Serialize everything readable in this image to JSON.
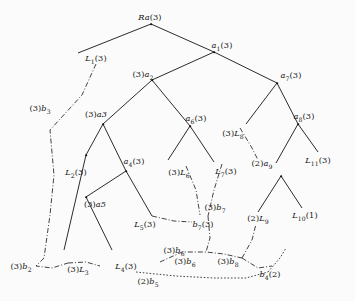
{
  "figure": {
    "kind": "tree-diagram",
    "background_color": "#fbfbfb",
    "ink_color": "#141414",
    "solid_edge_style": "solid",
    "aux_edge_style": "dash-dot",
    "dotted_edge_style": "dotted"
  },
  "labels": [
    {
      "id": "root",
      "text": "Ra(3)",
      "base": "Ra",
      "paren_left": "",
      "sub": "",
      "paren_right": "(3)",
      "x": 150,
      "y": 17
    },
    {
      "id": "a1",
      "text": "a1(3)",
      "base": "a",
      "paren_left": "",
      "sub": "1",
      "paren_right": "(3)",
      "x": 222,
      "y": 45
    },
    {
      "id": "L1",
      "text": "L1(3)",
      "base": "L",
      "paren_left": "",
      "sub": "1",
      "paren_right": "(3)",
      "x": 96,
      "y": 58
    },
    {
      "id": "a2",
      "text": "(3)a2",
      "base": "a",
      "paren_left": "(3)",
      "sub": "2",
      "paren_right": "",
      "x": 143,
      "y": 74
    },
    {
      "id": "a7",
      "text": "a7(3)",
      "base": "a",
      "paren_left": "",
      "sub": "7",
      "paren_right": "(3)",
      "x": 291,
      "y": 75
    },
    {
      "id": "b3",
      "text": "(3)b3",
      "base": "b",
      "paren_left": "(3)",
      "sub": "3",
      "paren_right": "",
      "x": 40,
      "y": 108
    },
    {
      "id": "a3",
      "text": "(3)a3",
      "base": "a3",
      "paren_left": "(3)",
      "sub": "",
      "paren_right": "",
      "x": 96,
      "y": 114
    },
    {
      "id": "a6",
      "text": "a6(3)",
      "base": "a",
      "paren_left": "",
      "sub": "6",
      "paren_right": "(3)",
      "x": 196,
      "y": 118
    },
    {
      "id": "a8",
      "text": "a8(3)",
      "base": "a",
      "paren_left": "",
      "sub": "8",
      "paren_right": "(3)",
      "x": 304,
      "y": 116
    },
    {
      "id": "L8",
      "text": "(3)L8",
      "base": "L",
      "paren_left": "(3)",
      "sub": "8",
      "paren_right": "",
      "x": 233,
      "y": 133
    },
    {
      "id": "L2",
      "text": "L2(3)",
      "base": "L",
      "paren_left": "",
      "sub": "2",
      "paren_right": "(3)",
      "x": 76,
      "y": 172
    },
    {
      "id": "a4",
      "text": "a4(3)",
      "base": "a",
      "paren_left": "",
      "sub": "4",
      "paren_right": "(3)",
      "x": 134,
      "y": 161
    },
    {
      "id": "L6",
      "text": "(3)L6",
      "base": "L",
      "paren_left": "(3)",
      "sub": "6",
      "paren_right": "",
      "x": 179,
      "y": 172
    },
    {
      "id": "L7",
      "text": "L7(3)",
      "base": "L",
      "paren_left": "",
      "sub": "7",
      "paren_right": "(3)",
      "x": 226,
      "y": 171
    },
    {
      "id": "a9",
      "text": "(2)a9",
      "base": "a",
      "paren_left": "(2)",
      "sub": "9",
      "paren_right": "",
      "x": 262,
      "y": 163
    },
    {
      "id": "L11",
      "text": "L11(3)",
      "base": "L",
      "paren_left": "",
      "sub": "11",
      "paren_right": "(3)",
      "x": 318,
      "y": 160
    },
    {
      "id": "a5",
      "text": "(3)a5",
      "base": "a5",
      "paren_left": "(3)",
      "sub": "",
      "paren_right": "",
      "x": 95,
      "y": 204
    },
    {
      "id": "L5",
      "text": "L5(3)",
      "base": "L",
      "paren_left": "",
      "sub": "5",
      "paren_right": "(3)",
      "x": 145,
      "y": 224
    },
    {
      "id": "b7",
      "text": "b7(3)",
      "base": "b",
      "paren_left": "",
      "sub": "7",
      "paren_right": "(3)",
      "x": 203,
      "y": 224
    },
    {
      "id": "b7b",
      "text": "(3)b7",
      "base": "b",
      "paren_left": "(3)",
      "sub": "7",
      "paren_right": "",
      "x": 215,
      "y": 207
    },
    {
      "id": "L9",
      "text": "(2)L9",
      "base": "L",
      "paren_left": "(2)",
      "sub": "9",
      "paren_right": "",
      "x": 258,
      "y": 218
    },
    {
      "id": "L10",
      "text": "L10(1)",
      "base": "L",
      "paren_left": "",
      "sub": "10",
      "paren_right": "(1)",
      "x": 305,
      "y": 215
    },
    {
      "id": "b2",
      "text": "(3)b2",
      "base": "b",
      "paren_left": "(3)",
      "sub": "2",
      "paren_right": "",
      "x": 21,
      "y": 266
    },
    {
      "id": "L3",
      "text": "(3)L3",
      "base": "L",
      "paren_left": "(3)",
      "sub": "3",
      "paren_right": "",
      "x": 78,
      "y": 269
    },
    {
      "id": "L4",
      "text": "L4(3)",
      "base": "L",
      "paren_left": "",
      "sub": "4",
      "paren_right": "(3)",
      "x": 126,
      "y": 266
    },
    {
      "id": "b5",
      "text": "(2)b5",
      "base": "b",
      "paren_left": "(2)",
      "sub": "5",
      "paren_right": "",
      "x": 148,
      "y": 281
    },
    {
      "id": "b6",
      "text": "(3)b6",
      "base": "b",
      "paren_left": "(3)",
      "sub": "6",
      "paren_right": "",
      "x": 174,
      "y": 250
    },
    {
      "id": "b6b",
      "text": "(3)b6",
      "base": "b",
      "paren_left": "(3)",
      "sub": "6",
      "paren_right": "",
      "x": 185,
      "y": 261
    },
    {
      "id": "b8",
      "text": "(3)b8",
      "base": "b",
      "paren_left": "(3)",
      "sub": "8",
      "paren_right": "",
      "x": 228,
      "y": 261
    },
    {
      "id": "b4",
      "text": "b4(2)",
      "base": "b",
      "paren_left": "",
      "sub": "4",
      "paren_right": "(2)",
      "x": 270,
      "y": 274
    }
  ],
  "solid_edges": [
    {
      "from": "root-pt",
      "x1": 151,
      "y1": 24,
      "x2": 78,
      "y2": 53
    },
    {
      "from": "root-right",
      "x1": 151,
      "y1": 24,
      "x2": 214,
      "y2": 52
    },
    {
      "from": "a1-left",
      "x1": 214,
      "y1": 52,
      "x2": 152,
      "y2": 80
    },
    {
      "from": "a1-right",
      "x1": 214,
      "y1": 52,
      "x2": 277,
      "y2": 83
    },
    {
      "from": "a2-l",
      "x1": 152,
      "y1": 80,
      "x2": 103,
      "y2": 124
    },
    {
      "from": "a2-r",
      "x1": 152,
      "y1": 80,
      "x2": 190,
      "y2": 126
    },
    {
      "from": "a3-l",
      "x1": 103,
      "y1": 124,
      "x2": 86,
      "y2": 155
    },
    {
      "from": "a3-r",
      "x1": 103,
      "y1": 124,
      "x2": 126,
      "y2": 171
    },
    {
      "from": "a6-l",
      "x1": 190,
      "y1": 126,
      "x2": 168,
      "y2": 160
    },
    {
      "from": "a6-r",
      "x1": 190,
      "y1": 126,
      "x2": 214,
      "y2": 162
    },
    {
      "from": "a7-l",
      "x1": 277,
      "y1": 83,
      "x2": 246,
      "y2": 124
    },
    {
      "from": "a7-r",
      "x1": 277,
      "y1": 83,
      "x2": 298,
      "y2": 124
    },
    {
      "from": "a8-l",
      "x1": 298,
      "y1": 124,
      "x2": 276,
      "y2": 163
    },
    {
      "from": "a8-r",
      "x1": 298,
      "y1": 124,
      "x2": 318,
      "y2": 152
    },
    {
      "from": "a5-l",
      "x1": 86,
      "y1": 155,
      "x2": 64,
      "y2": 250
    },
    {
      "from": "a5-r",
      "x1": 86,
      "y1": 197,
      "x2": 112,
      "y2": 250
    },
    {
      "from": "a4-l",
      "x1": 126,
      "y1": 171,
      "x2": 86,
      "y2": 197
    },
    {
      "from": "a4-r",
      "x1": 126,
      "y1": 171,
      "x2": 152,
      "y2": 216
    },
    {
      "from": "L10-l",
      "x1": 281,
      "y1": 176,
      "x2": 258,
      "y2": 212
    },
    {
      "from": "L10-r",
      "x1": 281,
      "y1": 176,
      "x2": 302,
      "y2": 208
    }
  ],
  "aux_edges": [
    {
      "id": "b3-chain",
      "points": "96,64 82,95 50,130 54,175 50,215 44,258"
    },
    {
      "id": "L1-b2",
      "points": "44,258 36,266 52,268 68,263"
    },
    {
      "id": "a3-L3",
      "points": "68,263 86,262 100,266"
    },
    {
      "id": "L5-b7",
      "points": "152,216 174,221 192,222"
    },
    {
      "id": "L6-b7",
      "points": "186,166 196,190 200,215"
    },
    {
      "id": "L7-b7",
      "points": "222,164 214,190 208,216"
    },
    {
      "id": "L8-b7",
      "points": "240,128 252,148 258,160"
    },
    {
      "id": "b7-down",
      "points": "208,216 210,238 206,252"
    },
    {
      "id": "b6-b8",
      "points": "160,262 182,252 206,252 224,254 242,258"
    },
    {
      "id": "L9-chain",
      "points": "242,258 252,240 256,224"
    },
    {
      "id": "b8-b4",
      "points": "242,258 258,268 272,266"
    }
  ],
  "dotted_edges": [
    {
      "id": "b5-b4",
      "points": "136,272 176,276 214,278 246,278 268,272"
    },
    {
      "id": "b4-up",
      "points": "268,272 280,258 286,248"
    }
  ]
}
